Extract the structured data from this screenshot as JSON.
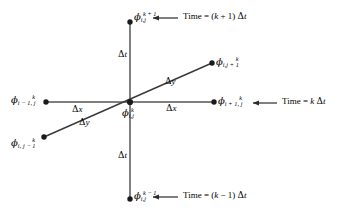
{
  "figure": {
    "type": "finite-difference-stencil",
    "caption": "",
    "colors": {
      "background": "#ffffff",
      "line": "#3a3a3a",
      "node": "#1a1a1a",
      "text": "#000000"
    }
  },
  "nodes": [
    {
      "id": "phi-top",
      "name": "node-i-j-k-plus-1",
      "symbol": "ϕ",
      "subscript": "i,j",
      "superscript": "k + 1",
      "position": {
        "x": 130,
        "y": 22
      },
      "label_pos": {
        "x": 134,
        "y": 13
      }
    },
    {
      "id": "phi-upper-right",
      "name": "node-i-j-plus-1-k",
      "symbol": "ϕ",
      "subscript": "i,j + 1",
      "superscript": "k",
      "position": {
        "x": 212,
        "y": 63
      },
      "label_pos": {
        "x": 216,
        "y": 58
      }
    },
    {
      "id": "phi-right",
      "name": "node-i-plus-1-j-k",
      "symbol": "ϕ",
      "subscript": "i + 1, j",
      "superscript": "k",
      "position": {
        "x": 214,
        "y": 102
      },
      "label_pos": {
        "x": 218,
        "y": 97
      }
    },
    {
      "id": "phi-center",
      "name": "node-i-j-k",
      "symbol": "ϕ",
      "subscript": "i,j",
      "superscript": "k",
      "position": {
        "x": 130,
        "y": 102
      },
      "label_pos": {
        "x": 122,
        "y": 108
      }
    },
    {
      "id": "phi-left",
      "name": "node-i-minus-1-j-k",
      "symbol": "ϕ",
      "subscript": "i − 1, j",
      "superscript": "k",
      "position": {
        "x": 46,
        "y": 102
      },
      "label_pos": {
        "x": 12,
        "y": 96
      }
    },
    {
      "id": "phi-lower-left",
      "name": "node-i-j-minus-1-k",
      "symbol": "ϕ",
      "subscript": "i, j − 1",
      "superscript": "k",
      "position": {
        "x": 44,
        "y": 137
      },
      "label_pos": {
        "x": 12,
        "y": 139
      }
    },
    {
      "id": "phi-bottom",
      "name": "node-i-j-k-minus-1",
      "symbol": "ϕ",
      "subscript": "i,j",
      "superscript": "k − 1",
      "position": {
        "x": 130,
        "y": 199
      },
      "label_pos": {
        "x": 134,
        "y": 192
      }
    }
  ],
  "intervals": [
    {
      "id": "dt-upper",
      "name": "delta-t-upper",
      "delta": "Δ",
      "variable": "t",
      "pos": {
        "x": 118,
        "y": 54
      }
    },
    {
      "id": "dt-lower",
      "name": "delta-t-lower",
      "delta": "Δ",
      "variable": "t",
      "pos": {
        "x": 118,
        "y": 155
      }
    },
    {
      "id": "dx-left",
      "name": "delta-x-left",
      "delta": "Δ",
      "variable": "x",
      "pos": {
        "x": 72,
        "y": 108
      }
    },
    {
      "id": "dx-right",
      "name": "delta-x-right",
      "delta": "Δ",
      "variable": "x",
      "pos": {
        "x": 166,
        "y": 105
      }
    },
    {
      "id": "dy-upper",
      "name": "delta-y-upper",
      "delta": "Δ",
      "variable": "y",
      "pos": {
        "x": 166,
        "y": 80
      }
    },
    {
      "id": "dy-lower",
      "name": "delta-y-lower",
      "delta": "Δ",
      "variable": "y",
      "pos": {
        "x": 78,
        "y": 121
      }
    }
  ],
  "time_annotations": [
    {
      "id": "time-k-plus-1",
      "name": "time-annotation-k-plus-1",
      "prefix": "Time = (",
      "var": "k",
      "mid": " + 1) ",
      "delta": "Δ",
      "unit": "t",
      "text": "Time = (k + 1) Δt",
      "label_pos": {
        "x": 182,
        "y": 13
      },
      "arrow": {
        "x1": 178,
        "y1": 18,
        "x2": 152,
        "y2": 18
      }
    },
    {
      "id": "time-k",
      "name": "time-annotation-k",
      "prefix": "Time = ",
      "var": "k",
      "mid": " ",
      "delta": "Δ",
      "unit": "t",
      "text": "Time = k Δt",
      "label_pos": {
        "x": 281,
        "y": 98
      },
      "arrow": {
        "x1": 277,
        "y1": 103,
        "x2": 252,
        "y2": 103
      }
    },
    {
      "id": "time-k-minus-1",
      "name": "time-annotation-k-minus-1",
      "prefix": "Time = (",
      "var": "k",
      "mid": " − 1) ",
      "delta": "Δ",
      "unit": "t",
      "text": "Time = (k − 1) Δt",
      "label_pos": {
        "x": 182,
        "y": 192
      },
      "arrow": {
        "x1": 178,
        "y1": 197,
        "x2": 152,
        "y2": 197
      }
    }
  ],
  "axes": {
    "time_axis": {
      "name": "time-axis-vertical",
      "x": 130,
      "y_top": 22,
      "y_bottom": 199
    },
    "x_axis": {
      "name": "x-axis-horizontal",
      "y": 102,
      "x_left": 46,
      "x_right": 214
    },
    "y_axis": {
      "name": "y-axis-diagonal",
      "x1": 44,
      "y1": 137,
      "x2": 212,
      "y2": 63
    }
  }
}
